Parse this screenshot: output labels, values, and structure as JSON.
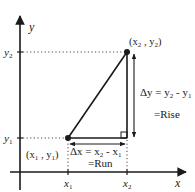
{
  "diagram": {
    "axes": {
      "x_label": "x",
      "y_label": "y"
    },
    "ticks": {
      "x1": "x",
      "x1_sub": "1",
      "x2": "x",
      "x2_sub": "2",
      "y1": "y",
      "y1_sub": "1",
      "y2": "y",
      "y2_sub": "2"
    },
    "points": {
      "p1": {
        "label_open": "(x",
        "sub_a": "1",
        "sep": " , y",
        "sub_b": "1",
        "label_close": ")"
      },
      "p2": {
        "label_open": "(x",
        "sub_a": "2",
        "sep": " , y",
        "sub_b": "2",
        "label_close": ")"
      }
    },
    "delta_y": {
      "lhs": "Δy = y",
      "sub_a": "2",
      "mid": " - y",
      "sub_b": "1",
      "equals_label": "=Rise"
    },
    "delta_x": {
      "lhs": "Δx = x",
      "sub_a": "2",
      "mid": " - x",
      "sub_b": "1",
      "equals_label": "=Run"
    },
    "colors": {
      "line": "#1a1a1a",
      "guide": "#333333",
      "background": "#ffffff"
    }
  }
}
